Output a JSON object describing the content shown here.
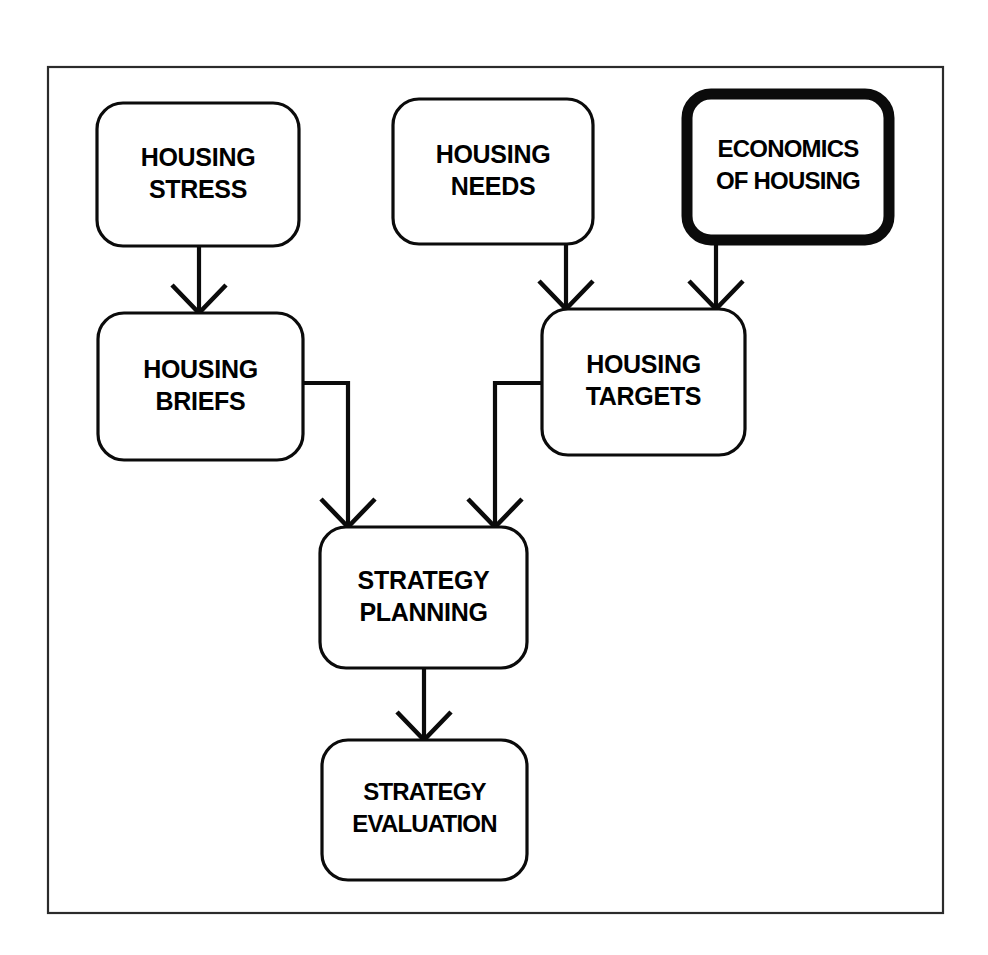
{
  "diagram": {
    "background_color": "#ffffff",
    "line_color": "#0b0b0b",
    "frame": {
      "name": "outer-frame",
      "x": 48,
      "y": 67,
      "width": 895,
      "height": 846,
      "stroke_color": "#2b2b2b"
    },
    "nodes": [
      {
        "id": "housing-stress",
        "lines": [
          "HOUSING",
          "STRESS"
        ],
        "x": 97,
        "y": 103,
        "width": 202,
        "height": 143,
        "radius": 26,
        "emphasis": false
      },
      {
        "id": "housing-needs",
        "lines": [
          "HOUSING",
          "NEEDS"
        ],
        "x": 393,
        "y": 99,
        "width": 200,
        "height": 145,
        "radius": 26,
        "emphasis": false
      },
      {
        "id": "economics-of-housing",
        "lines": [
          "ECONOMICS",
          "OF HOUSING"
        ],
        "x": 687,
        "y": 94,
        "width": 202,
        "height": 146,
        "radius": 24,
        "emphasis": true
      },
      {
        "id": "housing-briefs",
        "lines": [
          "HOUSING",
          "BRIEFS"
        ],
        "x": 98,
        "y": 313,
        "width": 205,
        "height": 147,
        "radius": 26,
        "emphasis": false
      },
      {
        "id": "housing-targets",
        "lines": [
          "HOUSING",
          "TARGETS"
        ],
        "x": 542,
        "y": 309,
        "width": 203,
        "height": 146,
        "radius": 26,
        "emphasis": false
      },
      {
        "id": "strategy-planning",
        "lines": [
          "STRATEGY",
          "PLANNING"
        ],
        "x": 320,
        "y": 527,
        "width": 207,
        "height": 141,
        "radius": 26,
        "emphasis": false
      },
      {
        "id": "strategy-evaluation",
        "lines": [
          "STRATEGY",
          "EVALUATION"
        ],
        "x": 322,
        "y": 740,
        "width": 205,
        "height": 140,
        "radius": 26,
        "emphasis": false
      }
    ],
    "connectors": [
      {
        "id": "stress-to-briefs",
        "from": "housing-stress",
        "to": "housing-briefs",
        "path": "M 199 246 L 199 313",
        "arrow": "M 172 285 L 199 313 L 226 285",
        "kind": "straight-down"
      },
      {
        "id": "needs-to-targets",
        "from": "housing-needs",
        "to": "housing-targets",
        "path": "M 566 244 L 566 309",
        "arrow": "M 539 281 L 566 309 L 593 281",
        "kind": "straight-down"
      },
      {
        "id": "economics-to-targets",
        "from": "economics-of-housing",
        "to": "housing-targets",
        "path": "M 716 240 L 716 309",
        "arrow": "M 689 281 L 716 309 L 743 281",
        "kind": "straight-down"
      },
      {
        "id": "briefs-to-planning",
        "from": "housing-briefs",
        "to": "strategy-planning",
        "path": "M 303 383 L 348 383 L 348 527",
        "arrow": "M 321 499 L 348 527 L 375 499",
        "kind": "elbow-right-down"
      },
      {
        "id": "targets-to-planning",
        "from": "housing-targets",
        "to": "strategy-planning",
        "path": "M 542 383 L 495 383 L 495 527",
        "arrow": "M 468 499 L 495 527 L 522 499",
        "kind": "elbow-left-down"
      },
      {
        "id": "planning-to-evaluation",
        "from": "strategy-planning",
        "to": "strategy-evaluation",
        "path": "M 424 668 L 424 740",
        "arrow": "M 397 712 L 424 740 L 451 712",
        "kind": "straight-down"
      }
    ]
  }
}
